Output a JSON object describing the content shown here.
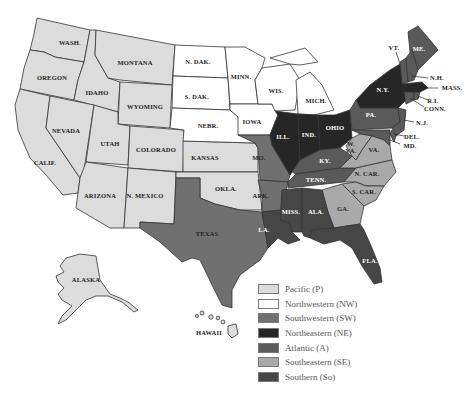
{
  "colors": {
    "P": "#dcdcdc",
    "NW": "#ffffff",
    "SW": "#707070",
    "NE": "#262626",
    "A": "#5a5a5a",
    "SE": "#a9a9a9",
    "So": "#464646"
  },
  "legend": [
    {
      "code": "P",
      "label": "Pacific (P)"
    },
    {
      "code": "NW",
      "label": "Northwestern (NW)"
    },
    {
      "code": "SW",
      "label": "Southwestern (SW)"
    },
    {
      "code": "NE",
      "label": "Northeastern (NE)"
    },
    {
      "code": "A",
      "label": "Atlantic (A)"
    },
    {
      "code": "SE",
      "label": "Southeastern (SE)"
    },
    {
      "code": "So",
      "label": "Southern (So)"
    }
  ],
  "states": {
    "wash": {
      "label": "WASH.",
      "region": "P"
    },
    "oregon": {
      "label": "OREGON",
      "region": "P"
    },
    "calif": {
      "label": "CALIF.",
      "region": "P"
    },
    "idaho": {
      "label": "IDAHO",
      "region": "P"
    },
    "nevada": {
      "label": "NEVADA",
      "region": "P"
    },
    "montana": {
      "label": "MONTANA",
      "region": "P"
    },
    "wyoming": {
      "label": "WYOMING",
      "region": "P"
    },
    "utah": {
      "label": "UTAH",
      "region": "P"
    },
    "colorado": {
      "label": "COLORADO",
      "region": "P"
    },
    "arizona": {
      "label": "ARIZONA",
      "region": "P"
    },
    "nmexico": {
      "label": "N. MEXICO",
      "region": "P"
    },
    "kansas": {
      "label": "KANSAS",
      "region": "P"
    },
    "okla": {
      "label": "OKLA.",
      "region": "P"
    },
    "alaska": {
      "label": "ALASKA",
      "region": "P"
    },
    "hawaii": {
      "label": "HAWAII",
      "region": "P"
    },
    "ndak": {
      "label": "N. DAK.",
      "region": "NW"
    },
    "sdak": {
      "label": "S. DAK.",
      "region": "NW"
    },
    "nebr": {
      "label": "NEBR.",
      "region": "NW"
    },
    "minn": {
      "label": "MINN.",
      "region": "NW"
    },
    "iowa": {
      "label": "IOWA",
      "region": "NW"
    },
    "wis": {
      "label": "WIS.",
      "region": "NW"
    },
    "mich": {
      "label": "MICH.",
      "region": "NW"
    },
    "texas": {
      "label": "TEXAS",
      "region": "SW"
    },
    "mo": {
      "label": "MO.",
      "region": "SW"
    },
    "ark": {
      "label": "ARK.",
      "region": "SW"
    },
    "ill": {
      "label": "ILL.",
      "region": "NE"
    },
    "ind": {
      "label": "IND.",
      "region": "NE"
    },
    "ohio": {
      "label": "OHIO",
      "region": "NE"
    },
    "ny": {
      "label": "N.Y.",
      "region": "NE"
    },
    "mass": {
      "label": "MASS.",
      "region": "NE"
    },
    "me": {
      "label": "ME.",
      "region": "A"
    },
    "vt": {
      "label": "VT.",
      "region": "A"
    },
    "nh": {
      "label": "N.H.",
      "region": "A"
    },
    "ri": {
      "label": "R.I.",
      "region": "A"
    },
    "conn": {
      "label": "CONN.",
      "region": "A"
    },
    "pa": {
      "label": "PA.",
      "region": "A"
    },
    "nj": {
      "label": "N.J.",
      "region": "A"
    },
    "del": {
      "label": "DEL.",
      "region": "A"
    },
    "md": {
      "label": "MD.",
      "region": "A"
    },
    "ky": {
      "label": "KY.",
      "region": "A"
    },
    "tenn": {
      "label": "TENN.",
      "region": "A"
    },
    "wva": {
      "label": "W. VA.",
      "region": "SE"
    },
    "va": {
      "label": "VA.",
      "region": "SE"
    },
    "ncar": {
      "label": "N. CAR.",
      "region": "SE"
    },
    "scar": {
      "label": "S. CAR.",
      "region": "SE"
    },
    "ga": {
      "label": "GA.",
      "region": "SE"
    },
    "miss": {
      "label": "MISS.",
      "region": "So"
    },
    "ala": {
      "label": "ALA.",
      "region": "So"
    },
    "la": {
      "label": "LA.",
      "region": "So"
    },
    "fla": {
      "label": "FLA.",
      "region": "So"
    }
  }
}
